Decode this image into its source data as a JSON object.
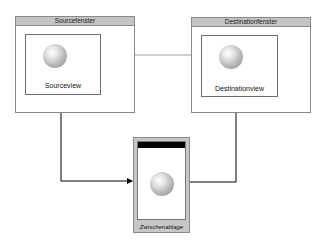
{
  "diagram": {
    "source_window": {
      "title": "Sourcefenster",
      "view_label": "Sourceview"
    },
    "destination_window": {
      "title": "Destinationfenster",
      "view_label": "Destinationview"
    },
    "clipboard": {
      "label": "Zwischenablage"
    },
    "colors": {
      "titlebar": "#c4c4c4",
      "border": "#8a8a8a",
      "direct_link": "#a0a0a0",
      "path_link": "#000000"
    }
  }
}
